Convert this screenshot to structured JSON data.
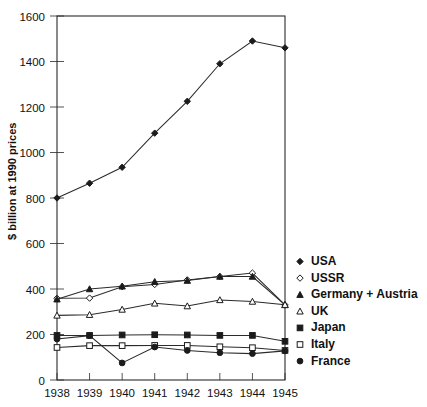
{
  "chart_data": {
    "type": "line",
    "title": "",
    "xlabel": "",
    "ylabel": "$ billion at 1990 prices",
    "categories": [
      "1938",
      "1939",
      "1940",
      "1941",
      "1942",
      "1943",
      "1944",
      "1945"
    ],
    "x": [
      1938,
      1939,
      1940,
      1941,
      1942,
      1943,
      1944,
      1945
    ],
    "ylim": [
      0,
      1600
    ],
    "yticks": [
      0,
      200,
      400,
      600,
      800,
      1000,
      1200,
      1400,
      1600
    ],
    "ytick_labels": [
      "0",
      "200",
      "400",
      "600",
      "800",
      "1000",
      "1200",
      "1400",
      "1600"
    ],
    "grid": false,
    "legend_position": "right",
    "series": [
      {
        "name": "USA",
        "marker": "filled-diamond",
        "values": [
          800,
          865,
          935,
          1085,
          1225,
          1390,
          1490,
          1460
        ]
      },
      {
        "name": "USSR",
        "marker": "open-diamond",
        "values": [
          359,
          360,
          410,
          420,
          440,
          455,
          470,
          330
        ]
      },
      {
        "name": "Germany + Austria",
        "marker": "filled-triangle",
        "values": [
          355,
          400,
          412,
          432,
          437,
          455,
          455,
          330
        ]
      },
      {
        "name": "UK",
        "marker": "open-triangle",
        "values": [
          284,
          287,
          310,
          337,
          325,
          352,
          345,
          331
        ]
      },
      {
        "name": "Japan",
        "marker": "filled-square",
        "values": [
          196,
          196,
          198,
          199,
          198,
          196,
          196,
          170
        ]
      },
      {
        "name": "Italy",
        "marker": "open-square",
        "values": [
          143,
          151,
          151,
          152,
          152,
          146,
          142,
          130
        ]
      },
      {
        "name": "France",
        "marker": "filled-circle",
        "values": [
          180,
          195,
          75,
          145,
          130,
          120,
          116,
          128
        ]
      }
    ]
  },
  "legend": {
    "items": [
      {
        "label": "USA",
        "marker": "filled-diamond"
      },
      {
        "label": "USSR",
        "marker": "open-diamond"
      },
      {
        "label": "Germany + Austria",
        "marker": "filled-triangle"
      },
      {
        "label": "UK",
        "marker": "open-triangle"
      },
      {
        "label": "Japan",
        "marker": "filled-square"
      },
      {
        "label": "Italy",
        "marker": "open-square"
      },
      {
        "label": "France",
        "marker": "filled-circle"
      }
    ]
  }
}
